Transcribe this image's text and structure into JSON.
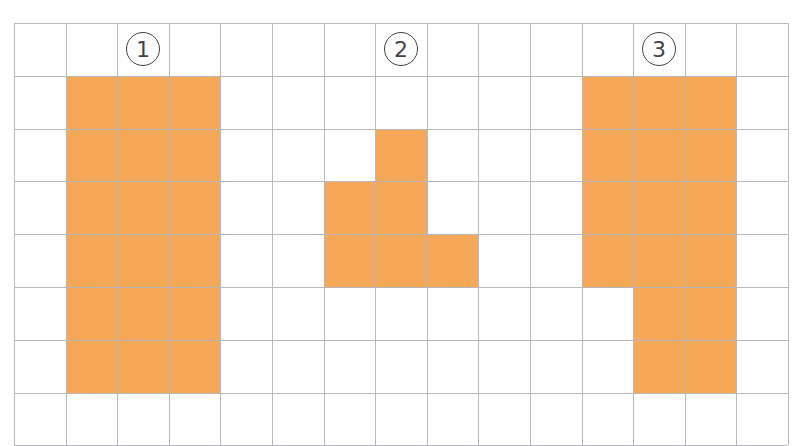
{
  "grid": {
    "cols": 15,
    "rows": 8,
    "cell_w": 51.6,
    "cell_h": 52.8,
    "line_color": "#b8b8bc",
    "fill_color": "#f5a958"
  },
  "shapes": [
    {
      "label": "①",
      "label_cell": [
        0,
        2
      ],
      "cells": [
        [
          1,
          1
        ],
        [
          1,
          2
        ],
        [
          1,
          3
        ],
        [
          2,
          1
        ],
        [
          2,
          2
        ],
        [
          2,
          3
        ],
        [
          3,
          1
        ],
        [
          3,
          2
        ],
        [
          3,
          3
        ],
        [
          4,
          1
        ],
        [
          4,
          2
        ],
        [
          4,
          3
        ],
        [
          5,
          1
        ],
        [
          5,
          2
        ],
        [
          5,
          3
        ],
        [
          6,
          1
        ],
        [
          6,
          2
        ],
        [
          6,
          3
        ]
      ]
    },
    {
      "label": "②",
      "label_cell": [
        0,
        7
      ],
      "cells": [
        [
          2,
          7
        ],
        [
          3,
          6
        ],
        [
          3,
          7
        ],
        [
          4,
          6
        ],
        [
          4,
          7
        ],
        [
          4,
          8
        ]
      ]
    },
    {
      "label": "③",
      "label_cell": [
        0,
        12
      ],
      "cells": [
        [
          1,
          11
        ],
        [
          1,
          12
        ],
        [
          1,
          13
        ],
        [
          2,
          11
        ],
        [
          2,
          12
        ],
        [
          2,
          13
        ],
        [
          3,
          11
        ],
        [
          3,
          12
        ],
        [
          3,
          13
        ],
        [
          4,
          11
        ],
        [
          4,
          12
        ],
        [
          4,
          13
        ],
        [
          5,
          12
        ],
        [
          5,
          13
        ],
        [
          6,
          12
        ],
        [
          6,
          13
        ]
      ]
    }
  ]
}
